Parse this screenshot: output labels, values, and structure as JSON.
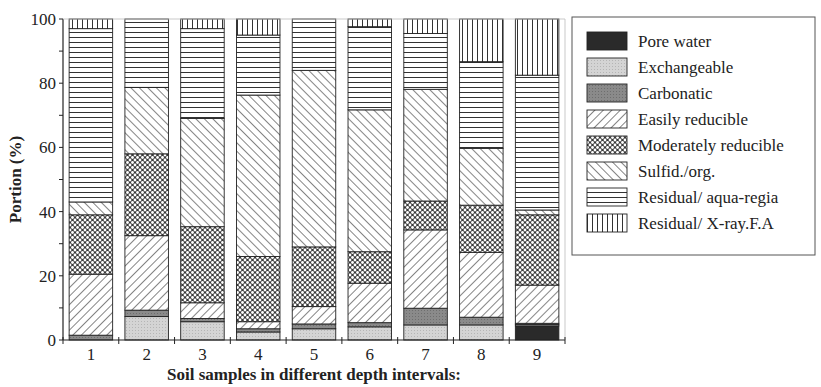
{
  "chart_data": {
    "type": "bar",
    "stacked": true,
    "xlabel": "Soil samples in different depth intervals:",
    "ylabel": "Portion (%)",
    "ylim": [
      0,
      100
    ],
    "yticks": [
      0,
      20,
      40,
      60,
      80,
      100
    ],
    "categories": [
      "1",
      "2",
      "3",
      "4",
      "5",
      "6",
      "7",
      "8",
      "9"
    ],
    "legend_position": "right",
    "grid": false,
    "series": [
      {
        "name": "Pore water",
        "pattern": "solid-dark",
        "values": [
          0,
          0,
          0,
          0,
          0,
          0,
          0,
          0,
          4.4
        ]
      },
      {
        "name": "Exchangeable",
        "pattern": "light-grey",
        "values": [
          0,
          7.3,
          5.7,
          2.5,
          3.5,
          4.1,
          4.7,
          4.7,
          0.4
        ]
      },
      {
        "name": "Carbonatic",
        "pattern": "mid-grey",
        "values": [
          1.5,
          2.0,
          1.0,
          1.0,
          1.5,
          1.3,
          5.2,
          2.4,
          0.4
        ]
      },
      {
        "name": "Easily reducible",
        "pattern": "diag-up",
        "values": [
          19.0,
          23.2,
          4.9,
          2.2,
          5.4,
          12.3,
          24.4,
          20.2,
          11.9
        ]
      },
      {
        "name": "Moderately reducible",
        "pattern": "crosshatch",
        "values": [
          18.5,
          25.5,
          23.7,
          20.3,
          18.6,
          9.8,
          9.0,
          14.7,
          21.9
        ]
      },
      {
        "name": "Sulfid./org.",
        "pattern": "diag-down",
        "values": [
          4.0,
          20.7,
          33.7,
          50.3,
          55.0,
          44.2,
          34.8,
          17.7,
          1.5
        ]
      },
      {
        "name": "Residual/ aqua-regia",
        "pattern": "horizontal",
        "values": [
          54.0,
          21.3,
          28.0,
          18.7,
          16.0,
          25.9,
          17.4,
          27.0,
          42.0
        ]
      },
      {
        "name": "Residual/ X-ray.F.A",
        "pattern": "vertical",
        "values": [
          3.0,
          0,
          3.0,
          5.0,
          0,
          2.4,
          4.5,
          13.3,
          17.5
        ]
      }
    ]
  }
}
